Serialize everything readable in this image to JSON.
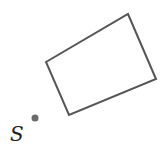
{
  "diagram": {
    "shape": {
      "type": "quadrilateral",
      "points": [
        [
          46,
          62
        ],
        [
          128,
          14
        ],
        [
          156,
          79
        ],
        [
          69,
          115
        ]
      ],
      "stroke": "#555555"
    },
    "point": {
      "label": "S",
      "x": 35,
      "y": 118,
      "color": "#6a6a6a"
    }
  }
}
